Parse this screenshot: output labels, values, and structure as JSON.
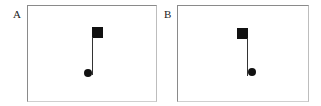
{
  "panels": [
    {
      "label": "A",
      "description": "square at top right of stem, dot at bottom left",
      "box": {
        "x": 27,
        "y": 5,
        "w": 128,
        "h": 95
      },
      "square": {
        "x": 92,
        "y": 27,
        "size": 11
      },
      "stem": {
        "x": 92,
        "y": 38,
        "h": 37
      },
      "dot": {
        "cx": 88,
        "cy": 73,
        "r": 4
      }
    },
    {
      "label": "B",
      "description": "square at top left of stem, dot at bottom right",
      "box": {
        "x": 177,
        "y": 5,
        "w": 130,
        "h": 95
      },
      "square": {
        "x": 237,
        "y": 28,
        "size": 11
      },
      "stem": {
        "x": 247,
        "y": 39,
        "h": 37
      },
      "dot": {
        "cx": 252,
        "cy": 72,
        "r": 4
      }
    }
  ],
  "colors": {
    "shape": "#111111",
    "border": "#8a8a8a"
  }
}
